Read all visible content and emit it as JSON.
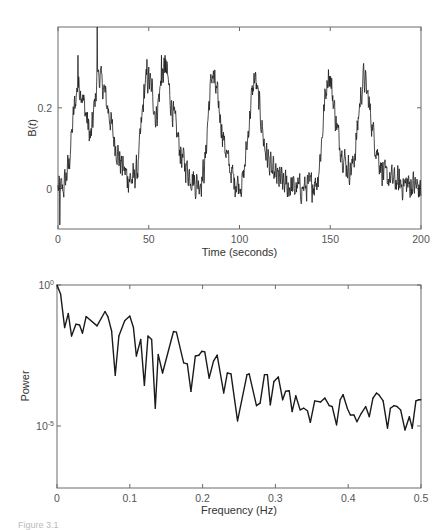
{
  "figure": {
    "caption": "Figure 3.1"
  },
  "chart_data": [
    {
      "type": "line",
      "panel": "top",
      "title": "",
      "xlabel": "Time (seconds)",
      "ylabel_base": "B(",
      "ylabel_var": "t",
      "ylabel_close": ")",
      "xlim": [
        0,
        200
      ],
      "ylim": [
        -0.1,
        0.4
      ],
      "xticks": [
        0,
        50,
        100,
        150,
        200
      ],
      "xtick_labels": [
        "0",
        "50",
        "100",
        "150",
        "200"
      ],
      "yticks": [
        0,
        0.2
      ],
      "ytick_labels": [
        "0",
        "0.2"
      ],
      "grid": false,
      "legend": "none",
      "description": "Noisy oscillating signal; smooth envelope keypoints listed, with additive noise of approx. amplitude noise_amplitude",
      "noise_amplitude": 0.045,
      "sample_interval": 0.2,
      "envelope": {
        "t": [
          0,
          3,
          6,
          9,
          11,
          13,
          16,
          18,
          20,
          22,
          25,
          28,
          31,
          34,
          38,
          41,
          44,
          46,
          48,
          50,
          52,
          54,
          56,
          58,
          60,
          62,
          65,
          68,
          72,
          76,
          79,
          81,
          83,
          85,
          88,
          91,
          94,
          97,
          100,
          102,
          104,
          106,
          108.5,
          111,
          114,
          118,
          125,
          130,
          135,
          140,
          143,
          145,
          147,
          149,
          151,
          154,
          157,
          160,
          162,
          164,
          166,
          168.5,
          171,
          174,
          177,
          180,
          185,
          190,
          195,
          200
        ],
        "value": [
          0.0,
          0.0,
          0.06,
          0.2,
          0.26,
          0.24,
          0.17,
          0.12,
          0.2,
          0.29,
          0.25,
          0.19,
          0.12,
          0.07,
          0.03,
          0.02,
          0.05,
          0.16,
          0.26,
          0.27,
          0.24,
          0.17,
          0.24,
          0.29,
          0.29,
          0.22,
          0.15,
          0.08,
          0.04,
          0.01,
          0.02,
          0.06,
          0.2,
          0.29,
          0.22,
          0.13,
          0.06,
          0.02,
          0.01,
          0.02,
          0.1,
          0.2,
          0.28,
          0.2,
          0.1,
          0.04,
          0.01,
          0.0,
          0.0,
          0.01,
          0.02,
          0.1,
          0.22,
          0.29,
          0.24,
          0.14,
          0.08,
          0.05,
          0.05,
          0.1,
          0.2,
          0.28,
          0.22,
          0.13,
          0.07,
          0.03,
          0.02,
          0.01,
          0.01,
          0.0
        ]
      },
      "spikes": [
        {
          "t": 11,
          "value": 0.33
        },
        {
          "t": 21.5,
          "value": 0.4
        },
        {
          "t": 49,
          "value": 0.32
        },
        {
          "t": 57,
          "value": 0.33
        },
        {
          "t": 59,
          "value": 0.33
        },
        {
          "t": 1,
          "value": -0.09
        }
      ]
    },
    {
      "type": "line",
      "panel": "bottom",
      "title": "",
      "xlabel": "Frequency (Hz)",
      "ylabel": "Power",
      "yscale": "log",
      "xlim": [
        0,
        0.5
      ],
      "ylim_log10": [
        -7.2,
        0
      ],
      "xticks": [
        0,
        0.1,
        0.2,
        0.3,
        0.4,
        0.5
      ],
      "xtick_labels": [
        "0",
        "0.1",
        "0.2",
        "0.3",
        "0.4",
        "0.5"
      ],
      "yticks_log10": [
        0,
        -5
      ],
      "ytick_base": "10",
      "ytick_exponents": [
        "0",
        "-5"
      ],
      "grid": false,
      "legend": "none",
      "frequency": [
        0,
        0.005,
        0.0105,
        0.0155,
        0.02,
        0.026,
        0.031,
        0.035,
        0.04,
        0.055,
        0.066,
        0.07,
        0.075,
        0.08,
        0.085,
        0.093,
        0.1,
        0.105,
        0.109,
        0.115,
        0.12,
        0.125,
        0.13,
        0.135,
        0.139,
        0.145,
        0.16,
        0.164,
        0.174,
        0.179,
        0.184,
        0.19,
        0.195,
        0.199,
        0.203,
        0.209,
        0.215,
        0.22,
        0.229,
        0.234,
        0.239,
        0.248,
        0.261,
        0.264,
        0.274,
        0.279,
        0.285,
        0.289,
        0.293,
        0.298,
        0.304,
        0.31,
        0.314,
        0.319,
        0.323,
        0.328,
        0.334,
        0.339,
        0.344,
        0.348,
        0.354,
        0.362,
        0.368,
        0.374,
        0.378,
        0.384,
        0.389,
        0.393,
        0.399,
        0.403,
        0.408,
        0.412,
        0.418,
        0.424,
        0.429,
        0.434,
        0.439,
        0.442,
        0.448,
        0.454,
        0.458,
        0.463,
        0.467,
        0.472,
        0.478,
        0.484,
        0.488,
        0.493,
        0.497,
        0.5
      ],
      "log10_power": [
        0,
        -0.33,
        -1.51,
        -1.01,
        -1.81,
        -1.39,
        -1.42,
        -1.71,
        -1.12,
        -1.45,
        -0.94,
        -1.13,
        -1.63,
        -3.2,
        -1.81,
        -1.27,
        -1.1,
        -1.51,
        -2.52,
        -1.93,
        -3.56,
        -1.81,
        -1.93,
        -4.37,
        -2.46,
        -3.12,
        -1.65,
        -1.67,
        -2.76,
        -2.8,
        -3.77,
        -2.52,
        -2.49,
        -2.35,
        -2.37,
        -3.3,
        -2.7,
        -2.49,
        -3.83,
        -3.12,
        -3.15,
        -4.82,
        -3.18,
        -3.15,
        -4.28,
        -4.19,
        -3.18,
        -3.18,
        -4.25,
        -3.42,
        -3.26,
        -4.07,
        -3.77,
        -3.75,
        -4.49,
        -3.93,
        -4.43,
        -4.37,
        -4.46,
        -4.87,
        -4.11,
        -4.15,
        -4.01,
        -4.28,
        -4.31,
        -4.96,
        -4.07,
        -3.89,
        -4.39,
        -4.61,
        -4.61,
        -4.85,
        -4.55,
        -4.31,
        -4.67,
        -4.01,
        -3.83,
        -3.89,
        -4.11,
        -5.08,
        -4.37,
        -4.28,
        -4.31,
        -4.43,
        -5.14,
        -4.67,
        -5.08,
        -4.11,
        -4.07,
        -4.07
      ]
    }
  ]
}
